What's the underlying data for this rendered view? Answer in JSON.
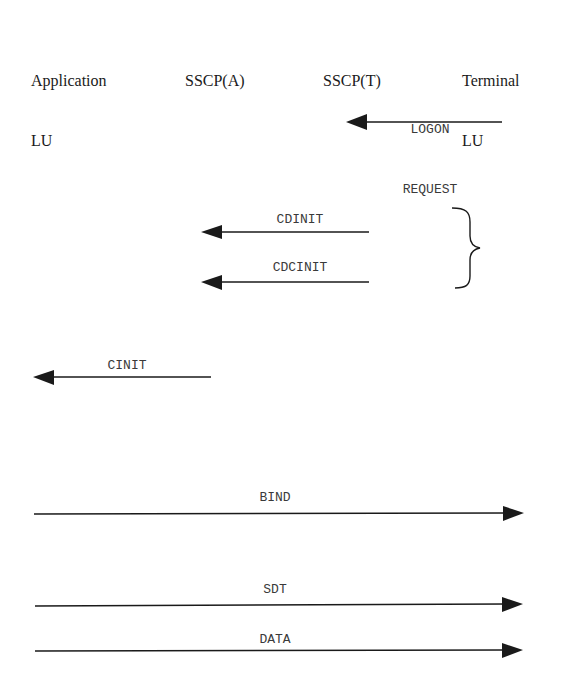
{
  "diagram": {
    "participants": [
      {
        "id": "app_lu",
        "line1": "Application",
        "line2": "LU"
      },
      {
        "id": "sscp_a",
        "line1": "SSCP(A)",
        "line2": ""
      },
      {
        "id": "sscp_t",
        "line1": "SSCP(T)",
        "line2": ""
      },
      {
        "id": "term_lu",
        "line1": "Terminal",
        "line2": "LU"
      }
    ],
    "messages": [
      {
        "label_line1": "LOGON",
        "label_line2": "REQUEST",
        "from": "Terminal LU",
        "to": "SSCP(T)",
        "direction": "left"
      },
      {
        "label": "CDINIT",
        "from": "SSCP(T)",
        "to": "SSCP(A)",
        "direction": "left"
      },
      {
        "label": "CDCINIT",
        "from": "SSCP(T)",
        "to": "SSCP(A)",
        "direction": "left"
      },
      {
        "label": "CINIT",
        "from": "SSCP(A)",
        "to": "Application LU",
        "direction": "left"
      },
      {
        "label": "BIND",
        "from": "Application LU",
        "to": "Terminal LU",
        "direction": "right"
      },
      {
        "label": "SDT",
        "from": "Application LU",
        "to": "Terminal LU",
        "direction": "right"
      },
      {
        "label": "DATA",
        "from": "Application LU",
        "to": "Terminal LU",
        "direction": "right"
      }
    ],
    "brace": {
      "groups": [
        "CDINIT",
        "CDCINIT"
      ],
      "side": "right"
    },
    "colors": {
      "line": "#1a1a1a",
      "text": "#3a3a3a"
    }
  }
}
